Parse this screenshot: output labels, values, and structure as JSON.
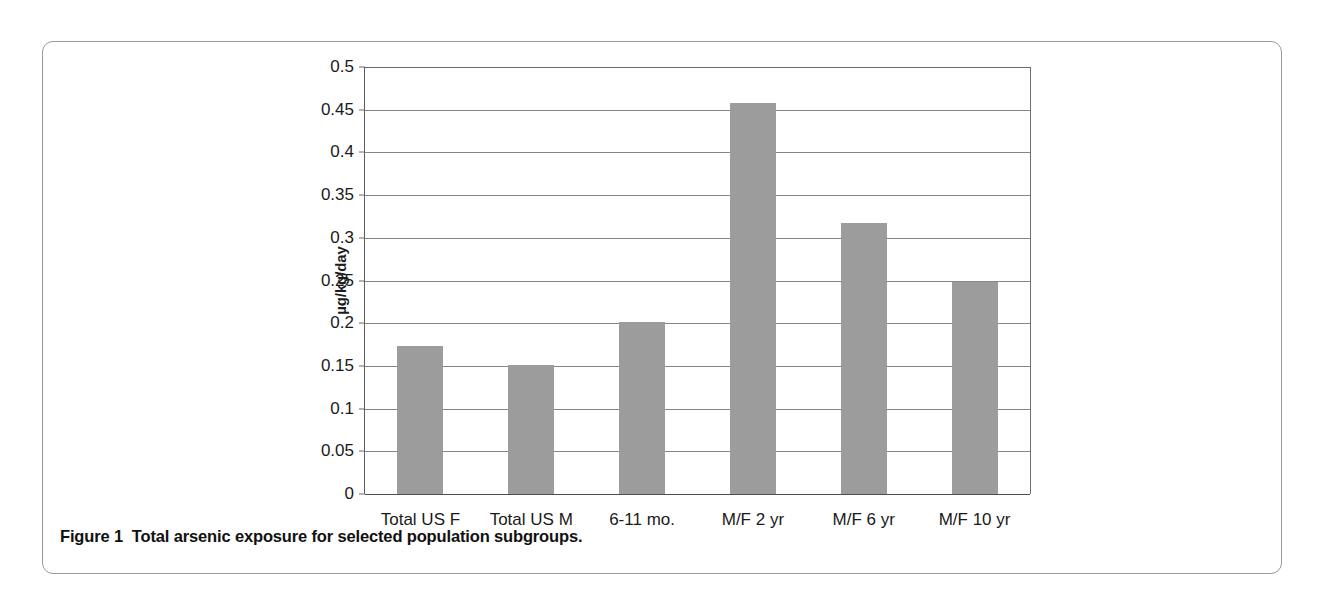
{
  "figure": {
    "caption_label": "Figure 1",
    "caption_text": "Total arsenic exposure for selected population subgroups."
  },
  "colors": {
    "bar_fill": "#9c9c9c",
    "gridline": "#868686",
    "axis": "#5b5b5b",
    "panel_border": "#9a9a9a",
    "text": "#1a1a1a"
  },
  "chart_data": {
    "type": "bar",
    "title": "",
    "xlabel": "",
    "ylabel": "µg/kg/day",
    "categories": [
      "Total US F",
      "Total US M",
      "6-11 mo.",
      "M/F 2 yr",
      "M/F 6 yr",
      "M/F 10 yr"
    ],
    "values": [
      0.173,
      0.151,
      0.202,
      0.458,
      0.317,
      0.248
    ],
    "ylim": [
      0,
      0.5
    ],
    "ytick_step": 0.05,
    "ytick_labels": [
      "0.5",
      "0.45",
      "0.4",
      "0.35",
      "0.3",
      "0.25",
      "0.2",
      "0.15",
      "0.1",
      "0.05",
      "0"
    ],
    "ytick_values": [
      0.5,
      0.45,
      0.4,
      0.35,
      0.3,
      0.25,
      0.2,
      0.15,
      0.1,
      0.05,
      0
    ],
    "grid": true,
    "legend": false,
    "legend_position": "none",
    "series": [
      {
        "name": "Total arsenic exposure",
        "values": [
          0.173,
          0.151,
          0.202,
          0.458,
          0.317,
          0.248
        ]
      }
    ]
  }
}
